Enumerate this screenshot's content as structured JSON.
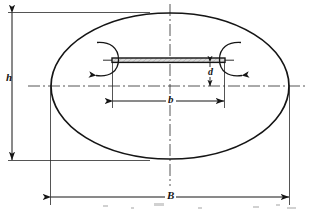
{
  "figure": {
    "kind": "engineering-cross-section-diagram",
    "background_color": "#ffffff",
    "line_color": "#151515",
    "plate_fill_color": "#d8d8d8"
  },
  "labels": {
    "h": "h",
    "d": "d",
    "b": "b",
    "B": "B"
  },
  "dimensions": [
    {
      "id": "h",
      "symbol": "h",
      "orientation": "vertical",
      "measures": "overall height of the ellipse (minor axis)",
      "label_position": "left",
      "arrow_style": "double-ended"
    },
    {
      "id": "B",
      "symbol": "B",
      "orientation": "horizontal",
      "measures": "overall width of the ellipse (major axis)",
      "label_position": "bottom-center",
      "arrow_style": "double-ended"
    },
    {
      "id": "b",
      "symbol": "b",
      "orientation": "horizontal",
      "measures": "width of the damper plate",
      "label_position": "center",
      "arrow_style": "double-ended"
    },
    {
      "id": "d",
      "symbol": "d",
      "orientation": "vertical",
      "measures": "offset of the plate below the duct centreline",
      "label_position": "right-of-centre",
      "arrow_style": "double-ended"
    }
  ],
  "shapes": {
    "ellipse": {
      "name": "duct-outline",
      "center_x": 170,
      "center_y": 86,
      "radius_x": 119,
      "radius_y": 73
    },
    "plate": {
      "name": "damper-plate",
      "left_x": 112,
      "right_x": 225,
      "top_y": 58,
      "thickness": 4
    },
    "centerlines": {
      "vertical_x": 170,
      "horizontal_y": 86,
      "style": "dash-dot"
    }
  },
  "rotation_arrows": [
    {
      "id": "left-rotation-arrow",
      "at_x": 112,
      "at_y": 60,
      "direction": "clockwise",
      "opening": "right"
    },
    {
      "id": "right-rotation-arrow",
      "at_x": 225,
      "at_y": 60,
      "direction": "counter-clockwise",
      "opening": "left"
    }
  ]
}
